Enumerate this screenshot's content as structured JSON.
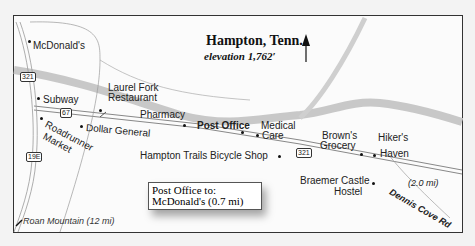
{
  "map": {
    "title": "Hampton, Tenn.",
    "elevation": "elevation 1,762′",
    "north_arrow_icon": "north-arrow-icon",
    "places": [
      {
        "name": "McDonald's"
      },
      {
        "name": "Subway"
      },
      {
        "name": "Laurel Fork"
      },
      {
        "name": "Restaurant"
      },
      {
        "name": "Pharmacy"
      },
      {
        "name": "Post Office"
      },
      {
        "name": "Medical"
      },
      {
        "name": "Care"
      },
      {
        "name": "Dollar General"
      },
      {
        "name": "Roadrunner"
      },
      {
        "name": "Market"
      },
      {
        "name": "Hampton Trails Bicycle Shop"
      },
      {
        "name": "Brown's"
      },
      {
        "name": "Grocery"
      },
      {
        "name": "Hiker's"
      },
      {
        "name": "Haven"
      },
      {
        "name": "Braemer Castle"
      },
      {
        "name": "Hostel"
      }
    ],
    "road_shields": [
      "321",
      "67",
      "19E",
      "321"
    ],
    "roads": {
      "dennis_cove": "Dennis Cove Rd",
      "dennis_cove_distance": "(2.0 mi)",
      "roan_mountain": "Roan Mountain (12 mi)"
    },
    "callout": {
      "line1": "Post Office to:",
      "line2": "McDonald's (0.7 mi)"
    },
    "colors": {
      "river": "#c8c8c8",
      "road": "#9a9a9a",
      "frame": "#333333"
    }
  }
}
